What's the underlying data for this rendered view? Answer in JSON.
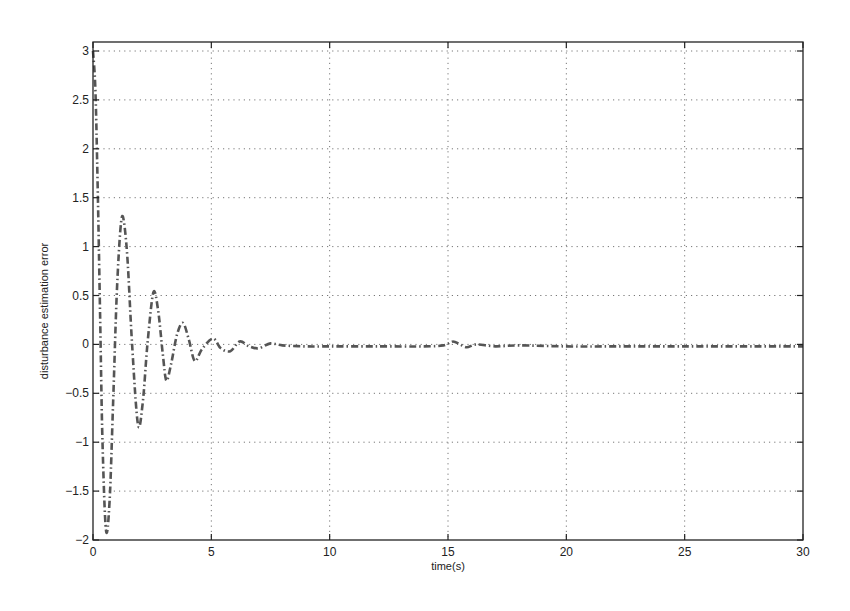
{
  "chart_data": {
    "type": "line",
    "title": "",
    "xlabel": "time(s)",
    "ylabel": "disturbance estimation error",
    "xlim": [
      0,
      30
    ],
    "ylim": [
      -2,
      3
    ],
    "xticks": [
      0,
      5,
      10,
      15,
      20,
      25,
      30
    ],
    "xtick_labels": [
      "0",
      "5",
      "10",
      "15",
      "20",
      "25",
      "30"
    ],
    "yticks": [
      3,
      2.5,
      2,
      1.5,
      1,
      0.5,
      0,
      -0.5,
      -1,
      -1.5,
      -2
    ],
    "ytick_labels": [
      "3",
      "2.5",
      "2",
      "1.5",
      "1",
      "0.5",
      "0",
      "−0.5",
      "−1",
      "−1.5",
      "−2"
    ],
    "grid": true,
    "legend": null,
    "series": [
      {
        "name": "disturbance estimation error",
        "style": "dash-dot",
        "color": "#555555",
        "x": [
          0,
          0.1,
          0.2,
          0.3,
          0.4,
          0.55,
          0.7,
          0.85,
          1.0,
          1.15,
          1.27,
          1.45,
          1.65,
          1.9,
          2.1,
          2.3,
          2.55,
          2.75,
          2.95,
          3.1,
          3.3,
          3.55,
          3.8,
          4.05,
          4.3,
          4.6,
          5.07,
          5.4,
          5.8,
          6.2,
          6.6,
          7.0,
          7.5,
          8.0,
          9.0,
          10.0,
          12.0,
          14.0,
          14.8,
          15.2,
          15.5,
          15.8,
          16.2,
          17.0,
          18.0,
          20.0,
          22.0,
          25.0,
          28.0,
          30.0
        ],
        "y": [
          3.0,
          2.6,
          1.6,
          0.3,
          -1.0,
          -1.9,
          -1.6,
          -0.6,
          0.5,
          1.15,
          1.3,
          0.9,
          0.0,
          -0.82,
          -0.6,
          0.0,
          0.53,
          0.35,
          -0.1,
          -0.37,
          -0.2,
          0.1,
          0.22,
          0.05,
          -0.17,
          -0.05,
          0.06,
          -0.04,
          -0.07,
          0.03,
          -0.02,
          -0.04,
          0.01,
          -0.01,
          -0.02,
          -0.02,
          -0.02,
          -0.02,
          -0.01,
          0.03,
          0.0,
          -0.03,
          0.0,
          -0.02,
          -0.01,
          -0.02,
          -0.02,
          -0.02,
          -0.02,
          -0.02
        ]
      }
    ],
    "plot_area_px": {
      "left": 93,
      "top": 42,
      "right": 803,
      "bottom": 540,
      "y_top_value_px": 51
    }
  }
}
